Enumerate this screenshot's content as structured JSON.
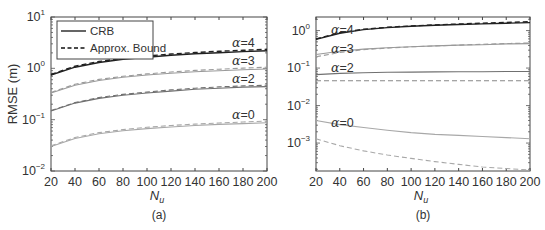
{
  "chart_data": [
    {
      "panel": "(a)",
      "type": "line",
      "title": "",
      "xlabel": "N_u",
      "ylabel": "RMSE (m)",
      "yscale": "log",
      "xlim": [
        20,
        200
      ],
      "ylim": [
        0.01,
        10
      ],
      "xticks": [
        20,
        40,
        60,
        80,
        100,
        120,
        140,
        160,
        180,
        200
      ],
      "yticks": [
        "10^-2",
        "10^-1",
        "10^0",
        "10^1"
      ],
      "grid": false,
      "legend": {
        "position": "upper left",
        "entries": [
          "CRB",
          "Approx. Bound"
        ]
      },
      "x": [
        20,
        40,
        60,
        80,
        100,
        120,
        140,
        160,
        180,
        200
      ],
      "series": [
        {
          "name": "CRB α=4",
          "style": "solid",
          "color": "#222222",
          "values": [
            0.74,
            1.05,
            1.3,
            1.5,
            1.65,
            1.8,
            1.92,
            2.02,
            2.12,
            2.2
          ]
        },
        {
          "name": "Approx. Bound α=4",
          "style": "dashed",
          "color": "#222222",
          "values": [
            0.76,
            1.1,
            1.36,
            1.57,
            1.74,
            1.9,
            2.03,
            2.15,
            2.25,
            2.35
          ]
        },
        {
          "name": "CRB α=3",
          "style": "solid",
          "color": "#9a9a9a",
          "values": [
            0.33,
            0.47,
            0.58,
            0.67,
            0.74,
            0.8,
            0.86,
            0.9,
            0.94,
            0.97
          ]
        },
        {
          "name": "Approx. Bound α=3",
          "style": "dashed",
          "color": "#9a9a9a",
          "values": [
            0.34,
            0.49,
            0.61,
            0.7,
            0.78,
            0.85,
            0.91,
            0.96,
            1.01,
            1.05
          ]
        },
        {
          "name": "CRB α=2",
          "style": "solid",
          "color": "#707070",
          "values": [
            0.148,
            0.21,
            0.26,
            0.3,
            0.33,
            0.36,
            0.39,
            0.41,
            0.43,
            0.44
          ]
        },
        {
          "name": "Approx. Bound α=2",
          "style": "dashed",
          "color": "#707070",
          "values": [
            0.15,
            0.215,
            0.27,
            0.31,
            0.345,
            0.38,
            0.41,
            0.435,
            0.455,
            0.47
          ]
        },
        {
          "name": "CRB α=0",
          "style": "solid",
          "color": "#a8a8a8",
          "values": [
            0.03,
            0.043,
            0.053,
            0.061,
            0.067,
            0.072,
            0.077,
            0.081,
            0.084,
            0.087
          ]
        },
        {
          "name": "Approx. Bound α=0",
          "style": "dashed",
          "color": "#a8a8a8",
          "values": [
            0.031,
            0.045,
            0.056,
            0.064,
            0.071,
            0.077,
            0.082,
            0.086,
            0.09,
            0.094
          ]
        }
      ],
      "annotations": [
        "α=4",
        "α=3",
        "α=2",
        "α=0"
      ]
    },
    {
      "panel": "(b)",
      "type": "line",
      "title": "",
      "xlabel": "N_u",
      "ylabel": "",
      "yscale": "log",
      "xlim": [
        20,
        200
      ],
      "ylim": [
        0.00018,
        2.3
      ],
      "xticks": [
        20,
        40,
        60,
        80,
        100,
        120,
        140,
        160,
        180,
        200
      ],
      "yticks": [
        "10^-3",
        "10^-2",
        "10^-1",
        "10^0"
      ],
      "grid": false,
      "x": [
        20,
        40,
        60,
        80,
        100,
        120,
        140,
        160,
        180,
        200
      ],
      "series": [
        {
          "name": "CRB α=4",
          "style": "solid",
          "color": "#222222",
          "values": [
            0.58,
            0.85,
            1.06,
            1.2,
            1.3,
            1.38,
            1.45,
            1.51,
            1.57,
            1.63
          ]
        },
        {
          "name": "Approx. Bound α=4",
          "style": "dashed",
          "color": "#222222",
          "values": [
            0.6,
            0.88,
            1.08,
            1.22,
            1.33,
            1.42,
            1.5,
            1.57,
            1.64,
            1.72
          ]
        },
        {
          "name": "CRB α=3",
          "style": "solid",
          "color": "#9a9a9a",
          "values": [
            0.23,
            0.28,
            0.32,
            0.35,
            0.37,
            0.39,
            0.41,
            0.42,
            0.44,
            0.45
          ]
        },
        {
          "name": "Approx. Bound α=3",
          "style": "dashed",
          "color": "#9a9a9a",
          "values": [
            0.2,
            0.26,
            0.31,
            0.34,
            0.37,
            0.39,
            0.41,
            0.43,
            0.45,
            0.47
          ]
        },
        {
          "name": "CRB α=2",
          "style": "solid",
          "color": "#707070",
          "values": [
            0.067,
            0.072,
            0.075,
            0.077,
            0.078,
            0.079,
            0.08,
            0.08,
            0.081,
            0.081
          ]
        },
        {
          "name": "Approx. Bound α=2",
          "style": "dashed",
          "color": "#888888",
          "values": [
            0.046,
            0.046,
            0.046,
            0.046,
            0.046,
            0.046,
            0.046,
            0.046,
            0.046,
            0.046
          ]
        },
        {
          "name": "CRB α=0",
          "style": "solid",
          "color": "#a8a8a8",
          "values": [
            0.004,
            0.0031,
            0.0026,
            0.0022,
            0.0019,
            0.0017,
            0.0016,
            0.0015,
            0.0014,
            0.0013
          ]
        },
        {
          "name": "Approx. Bound α=0",
          "style": "dashed",
          "color": "#a8a8a8",
          "values": [
            0.0013,
            0.00085,
            0.00062,
            0.00048,
            0.00039,
            0.00032,
            0.00027,
            0.00023,
            0.00021,
            0.00019
          ]
        }
      ],
      "annotations": [
        "α=4",
        "α=3",
        "α=2",
        "α=0"
      ]
    }
  ],
  "labels": {
    "ylabel_a": "RMSE (m)",
    "xlabel_main": "N",
    "xlabel_sub": "u",
    "caption_a": "(a)",
    "caption_b": "(b)",
    "legend_crb": "CRB",
    "legend_approx": "Approx. Bound",
    "alpha_symbol": "α",
    "alpha4": "=4",
    "alpha3": "=3",
    "alpha2": "=2",
    "alpha0": "=0",
    "xticks": [
      "20",
      "40",
      "60",
      "80",
      "100",
      "120",
      "140",
      "160",
      "180",
      "200"
    ],
    "ytick_base": "10",
    "yexp_a": [
      "1",
      "0",
      "−1",
      "−2"
    ],
    "yexp_b": [
      "0",
      "−1",
      "−2",
      "−3"
    ]
  }
}
